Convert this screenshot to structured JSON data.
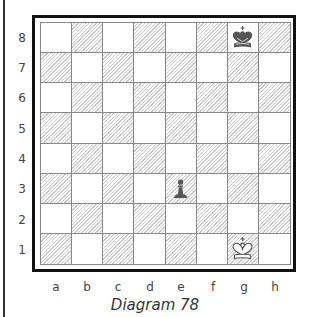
{
  "diagram": {
    "caption": "Diagram 78",
    "ranks": [
      "8",
      "7",
      "6",
      "5",
      "4",
      "3",
      "2",
      "1"
    ],
    "files": [
      "a",
      "b",
      "c",
      "d",
      "e",
      "f",
      "g",
      "h"
    ],
    "pieces": [
      {
        "square": "g8",
        "piece": "king",
        "color": "black"
      },
      {
        "square": "e3",
        "piece": "pawn",
        "color": "black"
      },
      {
        "square": "g1",
        "piece": "king",
        "color": "white"
      }
    ],
    "colors": {
      "border": "#111111",
      "grid": "#888888",
      "hatch": "#c9c9c9",
      "black_piece": "#555555"
    }
  }
}
